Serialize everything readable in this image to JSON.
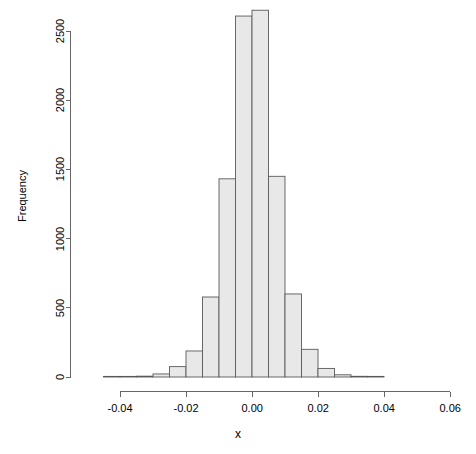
{
  "chart_data": {
    "type": "bar",
    "subtype": "histogram",
    "title": "",
    "xlabel": "x",
    "ylabel": "Frequency",
    "xlim": [
      -0.045,
      0.062
    ],
    "ylim": [
      0,
      2700
    ],
    "grid": false,
    "legend": null,
    "bin_width": 0.005,
    "bar_fill": "#e8e8e8",
    "bar_stroke": "#5a5a5a",
    "axis_color": "#666666",
    "xticks": [
      -0.04,
      -0.02,
      0.0,
      0.02,
      0.04,
      0.06
    ],
    "xtick_labels": [
      "-0.04",
      "-0.02",
      "0.00",
      "0.02",
      "0.04",
      "0.06"
    ],
    "yticks": [
      0,
      500,
      1000,
      1500,
      2000,
      2500
    ],
    "ytick_labels": [
      "0",
      "500",
      "1000",
      "1500",
      "2000",
      "2500"
    ],
    "bins": [
      {
        "x0": -0.045,
        "x1": -0.04,
        "value": 2
      },
      {
        "x0": -0.04,
        "x1": -0.035,
        "value": 3
      },
      {
        "x0": -0.035,
        "x1": -0.03,
        "value": 6
      },
      {
        "x0": -0.03,
        "x1": -0.025,
        "value": 22
      },
      {
        "x0": -0.025,
        "x1": -0.02,
        "value": 75
      },
      {
        "x0": -0.02,
        "x1": -0.015,
        "value": 188
      },
      {
        "x0": -0.015,
        "x1": -0.01,
        "value": 578
      },
      {
        "x0": -0.01,
        "x1": -0.005,
        "value": 1432
      },
      {
        "x0": -0.005,
        "x1": 0.0,
        "value": 2608
      },
      {
        "x0": 0.0,
        "x1": 0.005,
        "value": 2650
      },
      {
        "x0": 0.005,
        "x1": 0.01,
        "value": 1450
      },
      {
        "x0": 0.01,
        "x1": 0.015,
        "value": 600
      },
      {
        "x0": 0.015,
        "x1": 0.02,
        "value": 200
      },
      {
        "x0": 0.02,
        "x1": 0.025,
        "value": 62
      },
      {
        "x0": 0.025,
        "x1": 0.03,
        "value": 16
      },
      {
        "x0": 0.03,
        "x1": 0.035,
        "value": 5
      },
      {
        "x0": 0.035,
        "x1": 0.04,
        "value": 2
      }
    ]
  },
  "axes": {
    "y_title": "Frequency",
    "x_title": "x"
  }
}
